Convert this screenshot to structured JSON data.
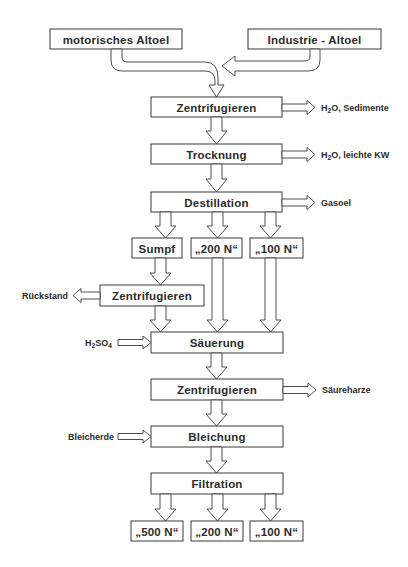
{
  "diagram": {
    "type": "process-flowchart",
    "inputs": {
      "motor_oil": "motorisches Altoel",
      "industrial_oil": "Industrie - Altoel"
    },
    "steps": {
      "centrifuge_1": "Zentrifugieren",
      "drying": "Trocknung",
      "distillation": "Destillation",
      "sump": "Sumpf",
      "dist_200n": "„200 N“",
      "dist_100n": "„100 N“",
      "centrifuge_2": "Zentrifugieren",
      "acidification": "Säuerung",
      "centrifuge_3": "Zentrifugieren",
      "bleaching": "Bleichung",
      "filtration": "Filtration"
    },
    "products": {
      "p500n": "„500 N“",
      "p200n": "„200 N“",
      "p100n": "„100 N“"
    },
    "side_streams": {
      "centrifuge_1_out_prefix": "H",
      "centrifuge_1_out_sub": "2",
      "centrifuge_1_out_rest": "O, Sedimente",
      "drying_out_prefix": "H",
      "drying_out_sub": "2",
      "drying_out_rest": "O, leichte KW",
      "distillation_out": "Gasoel",
      "centrifuge_2_out": "Rückstand",
      "acid_in_h": "H",
      "acid_in_sub1": "2",
      "acid_in_so": "SO",
      "acid_in_sub2": "4",
      "centrifuge_3_out": "Säureharze",
      "bleaching_in": "Bleicherde"
    }
  }
}
